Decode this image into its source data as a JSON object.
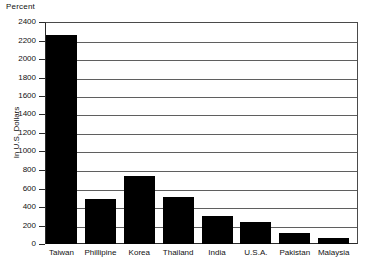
{
  "chart_data": {
    "type": "bar",
    "title": "",
    "unit_label": "Percent",
    "xlabel": "",
    "ylabel": "In U.S. Dollars",
    "categories": [
      "Taiwan",
      "Phillipine",
      "Korea",
      "Thailand",
      "India",
      "U.S.A.",
      "Pakistan",
      "Malaysia"
    ],
    "values": [
      2260,
      490,
      730,
      510,
      300,
      240,
      120,
      70
    ],
    "ylim": [
      0,
      2400
    ],
    "ytick_step": 200,
    "ytick_labels": [
      "2400",
      "2200",
      "2000",
      "1800",
      "1600",
      "1400",
      "1200",
      "1000",
      "800",
      "600",
      "400",
      "200",
      "0"
    ],
    "grid": true,
    "legend": "none",
    "bar_color": "#000000",
    "grid_color": "#5f5f5f",
    "axis_color": "#2a2a2a",
    "background": "#ffffff"
  }
}
